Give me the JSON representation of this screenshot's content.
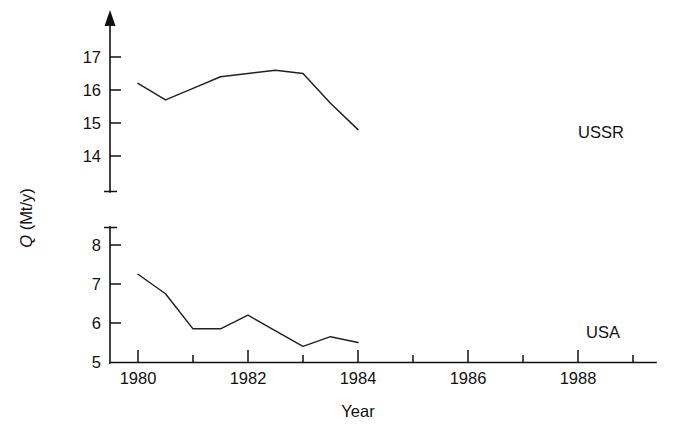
{
  "chart_data": {
    "type": "line",
    "title": "",
    "xlabel": "Year",
    "ylabel": "Q (Mt/y)",
    "ylabel_symbol": "Q",
    "ylabel_units": " (Mt/y)",
    "x": [
      1980,
      1981,
      1982,
      1983,
      1984,
      1985,
      1986,
      1987,
      1988
    ],
    "xlim": [
      1979.2,
      1989.1
    ],
    "xticks_major": [
      1980,
      1982,
      1984,
      1986,
      1988
    ],
    "xticklabels": [
      "1980",
      "1982",
      "1984",
      "1986",
      "1988"
    ],
    "xticks_minor": [
      1981,
      1983,
      1985,
      1987
    ],
    "grid": false,
    "legend_position": "inline-right-of-line-end",
    "broken_axis": true,
    "panels": [
      {
        "name": "upper",
        "ylim": [
          13.5,
          17.45
        ],
        "yticks": [
          14,
          15,
          16,
          17
        ],
        "yticklabels": [
          "14",
          "15",
          "16",
          "17"
        ],
        "series": [
          {
            "name": "USSR",
            "label": "USSR",
            "color": "#222222",
            "values": [
              16.2,
              15.7,
              16.05,
              16.4,
              16.5,
              16.6,
              16.5,
              15.6,
              14.8
            ]
          }
        ]
      },
      {
        "name": "lower",
        "ylim": [
          5.0,
          8.4
        ],
        "yticks": [
          5,
          6,
          7,
          8
        ],
        "yticklabels": [
          "5",
          "6",
          "7",
          "8"
        ],
        "series": [
          {
            "name": "USA",
            "label": "USA",
            "color": "#222222",
            "values": [
              7.25,
              6.75,
              5.85,
              5.85,
              6.2,
              5.8,
              5.4,
              5.65,
              5.5
            ]
          }
        ]
      }
    ]
  },
  "labels": {
    "y_axis_symbol": "Q",
    "y_axis_units": " (Mt/y)",
    "x_axis_title": "Year",
    "ussr": "USSR",
    "usa": "USA",
    "y_upper_17": "17",
    "y_upper_16": "16",
    "y_upper_15": "15",
    "y_upper_14": "14",
    "y_lower_8": "8",
    "y_lower_7": "7",
    "y_lower_6": "6",
    "y_lower_5": "5",
    "x_1980": "1980",
    "x_1982": "1982",
    "x_1984": "1984",
    "x_1986": "1986",
    "x_1988": "1988"
  }
}
